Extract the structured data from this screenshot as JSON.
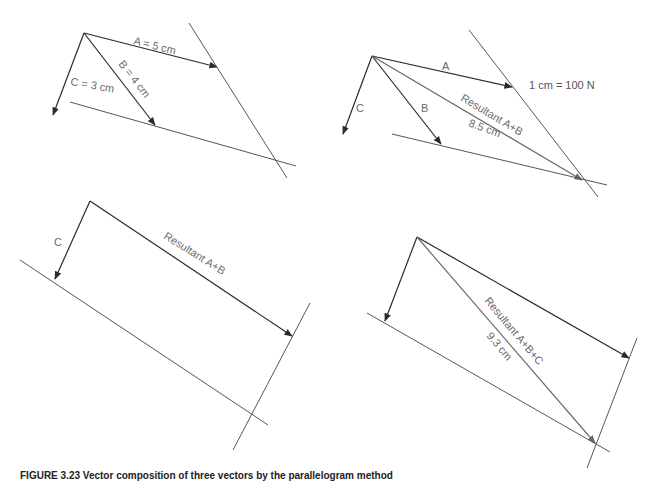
{
  "figure": {
    "caption": "FIGURE 3.23 Vector composition of three vectors by the parallelogram method",
    "panels": [
      {
        "id": "panel-1",
        "labels": {
          "a": "A = 5 cm",
          "b": "B = 4 cm",
          "c": "C = 3 cm"
        }
      },
      {
        "id": "panel-2",
        "labels": {
          "a": "A",
          "b": "B",
          "c": "C",
          "scale": "1 cm = 100 N",
          "resultant": "Resultant A+B",
          "resultant_length": "8.5 cm"
        }
      },
      {
        "id": "panel-3",
        "labels": {
          "c": "C",
          "resultant": "Resultant A+B"
        }
      },
      {
        "id": "panel-4",
        "labels": {
          "resultant": "Resultant A+B+C",
          "resultant_length": "9.3 cm"
        }
      }
    ],
    "colors": {
      "vector": "#2a2a2a",
      "resultant": "#6a6a6a",
      "label": "#6b6b6b"
    }
  }
}
